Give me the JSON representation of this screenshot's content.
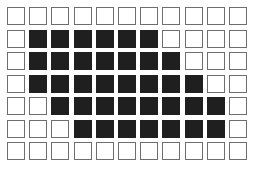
{
  "grid": {
    "rows": 7,
    "cols": 11,
    "filled_color": "#1f1f1f",
    "empty_color": "#ffffff",
    "border_color": "#6e6e6e",
    "cells": [
      [
        0,
        0,
        0,
        0,
        0,
        0,
        0,
        0,
        0,
        0,
        0
      ],
      [
        0,
        1,
        1,
        1,
        1,
        1,
        1,
        0,
        0,
        0,
        0
      ],
      [
        0,
        1,
        1,
        1,
        1,
        1,
        1,
        1,
        0,
        0,
        0
      ],
      [
        0,
        1,
        1,
        1,
        1,
        1,
        1,
        1,
        1,
        0,
        0
      ],
      [
        0,
        0,
        1,
        1,
        1,
        1,
        1,
        1,
        1,
        1,
        0
      ],
      [
        0,
        0,
        0,
        1,
        1,
        1,
        1,
        1,
        1,
        1,
        0
      ],
      [
        0,
        0,
        0,
        0,
        0,
        0,
        0,
        0,
        0,
        0,
        0
      ]
    ]
  },
  "caption": "— — — — — — — —"
}
